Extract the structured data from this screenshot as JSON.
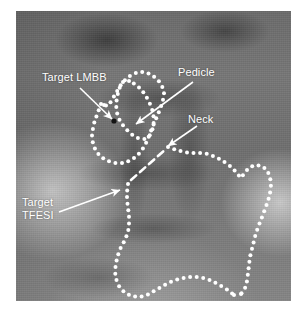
{
  "figure": {
    "modality": "fluoroscopy",
    "view": "oblique (Scotty dog)",
    "plate": {
      "x": 16,
      "y": 11,
      "width": 275,
      "height": 290
    }
  },
  "style": {
    "annotation_color": "#ffffff",
    "dot_color": "#ffffff",
    "label_font_size": 11,
    "dot_radius": 2.0,
    "arrow_width": 1.6
  },
  "labels": [
    {
      "id": "target-lmbb",
      "text": "Target LMBB",
      "x": 42,
      "y": 71,
      "lines": [
        "Target LMBB"
      ]
    },
    {
      "id": "pedicle",
      "text": "Pedicle",
      "x": 178,
      "y": 66,
      "lines": [
        "Pedicle"
      ]
    },
    {
      "id": "neck",
      "text": "Neck",
      "x": 188,
      "y": 113,
      "lines": [
        "Neck"
      ]
    },
    {
      "id": "target-tfesi",
      "text": "Target TFESI",
      "x": 22,
      "y": 196,
      "lines": [
        "Target",
        "TFESI"
      ]
    }
  ],
  "arrows": [
    {
      "id": "arrow-target-lmbb",
      "points_to": "target-lmbb",
      "x1": 80,
      "y1": 88,
      "x2": 112,
      "y2": 119
    },
    {
      "id": "arrow-pedicle",
      "points_to": "pedicle",
      "x1": 193,
      "y1": 82,
      "x2": 136,
      "y2": 124
    },
    {
      "id": "arrow-neck",
      "points_to": "neck",
      "x1": 197,
      "y1": 126,
      "x2": 168,
      "y2": 146
    },
    {
      "id": "arrow-target-tfesi",
      "points_to": "target-tfesi",
      "x1": 59,
      "y1": 212,
      "x2": 120,
      "y2": 190
    }
  ],
  "markers": [
    {
      "id": "lmbb-target-point",
      "kind": "dark-dot",
      "x": 114,
      "y": 121,
      "r": 2.6
    }
  ],
  "outlines": [
    {
      "id": "scotty-dog-outline",
      "kind": "dotted",
      "note": "outer Scotty dog / vertebral outline",
      "points": [
        [
          101,
          104
        ],
        [
          98,
          112
        ],
        [
          95,
          120
        ],
        [
          93,
          128
        ],
        [
          92,
          136
        ],
        [
          93,
          144
        ],
        [
          96,
          151
        ],
        [
          101,
          157
        ],
        [
          108,
          161
        ],
        [
          116,
          163
        ],
        [
          124,
          163
        ],
        [
          131,
          160
        ],
        [
          137,
          156
        ],
        [
          142,
          150
        ],
        [
          146,
          143
        ],
        [
          149,
          136
        ],
        [
          152,
          128
        ],
        [
          155,
          121
        ],
        [
          158,
          114
        ],
        [
          161,
          107
        ],
        [
          163,
          100
        ],
        [
          164,
          93
        ],
        [
          162,
          86
        ],
        [
          158,
          80
        ],
        [
          152,
          75
        ],
        [
          145,
          72
        ],
        [
          138,
          72
        ],
        [
          131,
          75
        ],
        [
          125,
          80
        ],
        [
          120,
          86
        ],
        [
          116,
          93
        ],
        [
          112,
          100
        ],
        [
          108,
          106
        ],
        [
          104,
          105
        ]
      ]
    },
    {
      "id": "pedicle-outline",
      "kind": "dotted",
      "note": "pedicle oval (inner ring)",
      "points": [
        [
          123,
          82
        ],
        [
          119,
          89
        ],
        [
          117,
          97
        ],
        [
          116,
          105
        ],
        [
          117,
          113
        ],
        [
          120,
          121
        ],
        [
          125,
          128
        ],
        [
          131,
          134
        ],
        [
          138,
          138
        ],
        [
          145,
          139
        ],
        [
          150,
          135
        ],
        [
          153,
          128
        ],
        [
          154,
          120
        ],
        [
          153,
          112
        ],
        [
          150,
          104
        ],
        [
          146,
          96
        ],
        [
          141,
          89
        ],
        [
          135,
          84
        ],
        [
          129,
          81
        ]
      ]
    },
    {
      "id": "neck-dashed-line",
      "kind": "dashed",
      "note": "neck of the Scotty dog",
      "points": [
        [
          131,
          180
        ],
        [
          140,
          172
        ],
        [
          149,
          164
        ],
        [
          158,
          156
        ],
        [
          166,
          149
        ]
      ]
    },
    {
      "id": "body-lateral-outline",
      "kind": "dotted",
      "note": "lateral body / transverse process outline running right and down",
      "points": [
        [
          168,
          147
        ],
        [
          176,
          150
        ],
        [
          184,
          152
        ],
        [
          192,
          153
        ],
        [
          200,
          153
        ],
        [
          208,
          154
        ],
        [
          216,
          157
        ],
        [
          223,
          161
        ],
        [
          230,
          166
        ],
        [
          236,
          172
        ],
        [
          241,
          178
        ],
        [
          245,
          172
        ],
        [
          250,
          167
        ],
        [
          256,
          165
        ],
        [
          262,
          166
        ],
        [
          267,
          170
        ],
        [
          270,
          177
        ],
        [
          271,
          185
        ],
        [
          270,
          193
        ],
        [
          268,
          201
        ],
        [
          265,
          209
        ],
        [
          262,
          217
        ],
        [
          259,
          225
        ],
        [
          256,
          233
        ],
        [
          254,
          241
        ],
        [
          252,
          249
        ],
        [
          250,
          257
        ],
        [
          249,
          265
        ],
        [
          248,
          273
        ],
        [
          247,
          281
        ],
        [
          245,
          288
        ],
        [
          241,
          294
        ]
      ]
    },
    {
      "id": "inferior-outline",
      "kind": "dotted",
      "note": "inferior margin running down-left then across the bottom",
      "points": [
        [
          128,
          184
        ],
        [
          127,
          192
        ],
        [
          127,
          200
        ],
        [
          128,
          208
        ],
        [
          129,
          216
        ],
        [
          129,
          224
        ],
        [
          128,
          232
        ],
        [
          125,
          240
        ],
        [
          121,
          247
        ],
        [
          118,
          255
        ],
        [
          116,
          263
        ],
        [
          115,
          271
        ],
        [
          116,
          279
        ],
        [
          119,
          286
        ],
        [
          124,
          292
        ],
        [
          131,
          296
        ],
        [
          139,
          297
        ],
        [
          147,
          295
        ],
        [
          154,
          291
        ],
        [
          161,
          287
        ],
        [
          168,
          283
        ],
        [
          175,
          280
        ],
        [
          183,
          278
        ],
        [
          191,
          277
        ],
        [
          199,
          277
        ],
        [
          207,
          279
        ],
        [
          214,
          282
        ],
        [
          221,
          286
        ],
        [
          228,
          290
        ],
        [
          234,
          295
        ]
      ]
    }
  ]
}
